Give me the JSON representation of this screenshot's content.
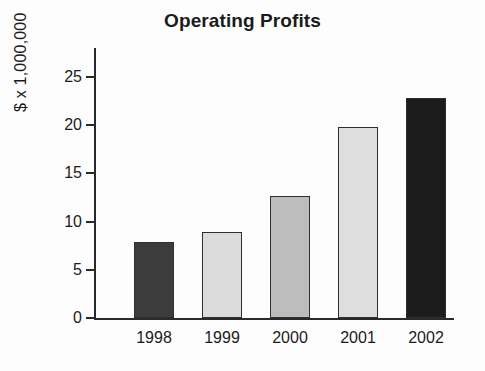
{
  "chart_data": {
    "type": "bar",
    "title": "Operating Profits",
    "xlabel": "",
    "ylabel": "$ x 1,000,000",
    "categories": [
      "1998",
      "1999",
      "2000",
      "2001",
      "2002"
    ],
    "values": [
      7.9,
      8.9,
      12.7,
      19.8,
      22.8
    ],
    "ylim": [
      0,
      25
    ],
    "y_ticks": [
      0,
      5,
      10,
      15,
      20,
      25
    ],
    "y_tick_labels": [
      "0",
      "5",
      "10",
      "15",
      "20",
      "25"
    ],
    "grid": false,
    "legend": "none",
    "bar_colors": [
      "#3c3c3c",
      "#dcdcdc",
      "#bdbdbd",
      "#dedede",
      "#1c1c1c"
    ],
    "bar_edge_color": "#2f2f2f",
    "axis_color": "#2a2a2a",
    "background": "#fdfdfd"
  }
}
